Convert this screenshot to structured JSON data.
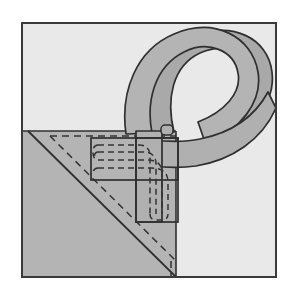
{
  "figure": {
    "title": "Strap loop stitched to triangular corner panel",
    "type": "technical-line-illustration",
    "canvas": {
      "width": 285,
      "height": 286
    },
    "colors": {
      "page_background": "#ffffff",
      "frame_background": "#e9e9e9",
      "frame_border": "#3a3a3a",
      "panel_gray": "#b4b4b4",
      "strap_gray": "#b0b0b0",
      "strap_shadow": "#a2a2a2",
      "outline": "#2f2f2f",
      "stitch_dash": "#333333"
    },
    "frame": {
      "x": 21,
      "y": 22,
      "width": 256,
      "height": 256,
      "border_width": 2
    },
    "parts": [
      {
        "name": "corner-panel",
        "label": "Triangular fabric corner panel",
        "fill": "#b4b4b4",
        "region": "lower-left quadrant up to x=176, from y=131 to y=277"
      },
      {
        "name": "fold-line",
        "label": "Solid diagonal fold edge",
        "style": "solid",
        "from": [
          28,
          131
        ],
        "to": [
          176,
          277
        ]
      },
      {
        "name": "fold-stitch-line",
        "label": "Dashed seam parallel to fold edge",
        "style": "dashed",
        "offset_px": 14
      },
      {
        "name": "strap-loop",
        "label": "Webbing strap formed into a twisted loop",
        "fill": "#b0b0b0",
        "width_px": 26
      },
      {
        "name": "strap-tail-vertical",
        "label": "Strap tail running down into panel",
        "fill": "#b0b0b0"
      },
      {
        "name": "stitch-box-horizontal",
        "label": "Horizontal stitched attachment box",
        "x": 91,
        "y": 138,
        "width": 87,
        "height": 42
      },
      {
        "name": "stitch-box-vertical",
        "label": "Vertical stitched attachment box",
        "x": 136,
        "y": 138,
        "width": 42,
        "height": 84
      },
      {
        "name": "stitching-l-pattern",
        "label": "Nested L-shaped dashed stitch runs",
        "rows": 4,
        "style": "dashed",
        "corner": "rounded"
      }
    ],
    "annotations": []
  }
}
